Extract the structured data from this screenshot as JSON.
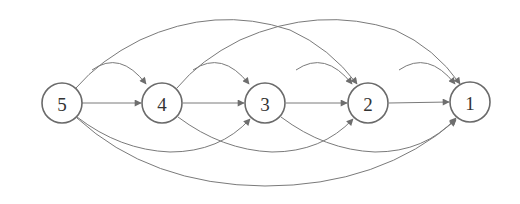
{
  "diagram": {
    "type": "directed-graph",
    "nodes": [
      {
        "id": "5",
        "label": "5",
        "x": 62,
        "y": 103
      },
      {
        "id": "4",
        "label": "4",
        "x": 162,
        "y": 103
      },
      {
        "id": "3",
        "label": "3",
        "x": 265,
        "y": 103
      },
      {
        "id": "2",
        "label": "2",
        "x": 368,
        "y": 103
      },
      {
        "id": "1",
        "label": "1",
        "x": 470,
        "y": 102
      }
    ],
    "edges": [
      {
        "from": "5",
        "to": "4",
        "style": "straight"
      },
      {
        "from": "4",
        "to": "3",
        "style": "straight"
      },
      {
        "from": "3",
        "to": "2",
        "style": "straight"
      },
      {
        "from": "2",
        "to": "1",
        "style": "straight"
      },
      {
        "from": "5",
        "to": "4",
        "style": "short-arc-top"
      },
      {
        "from": "4",
        "to": "3",
        "style": "short-arc-top"
      },
      {
        "from": "3",
        "to": "2",
        "style": "short-arc-top"
      },
      {
        "from": "2",
        "to": "1",
        "style": "short-arc-top"
      },
      {
        "from": "5",
        "to": "2",
        "style": "long-arc-top"
      },
      {
        "from": "4",
        "to": "1",
        "style": "long-arc-top"
      },
      {
        "from": "5",
        "to": "3",
        "style": "arc-bottom"
      },
      {
        "from": "4",
        "to": "2",
        "style": "arc-bottom"
      },
      {
        "from": "3",
        "to": "1",
        "style": "arc-bottom"
      },
      {
        "from": "5",
        "to": "1",
        "style": "long-arc-bottom"
      }
    ],
    "colors": {
      "edge": "#7a7a7a",
      "node_stroke": "#6a6a6a",
      "label": "#333333"
    }
  }
}
